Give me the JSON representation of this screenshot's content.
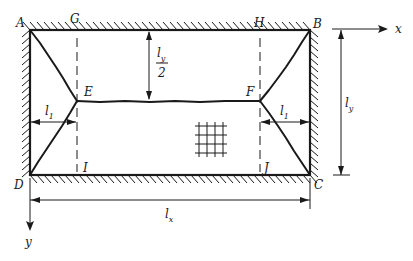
{
  "diagram": {
    "corner_labels": {
      "A": "A",
      "B": "B",
      "C": "C",
      "D": "D"
    },
    "point_labels": {
      "E": "E",
      "F": "F",
      "G": "G",
      "H": "H",
      "I": "I",
      "J": "J"
    },
    "axes": {
      "x": "x",
      "y": "y"
    },
    "dimensions": {
      "ly_half": {
        "main": "l",
        "sub": "y",
        "denominator": "2"
      },
      "ly": {
        "main": "l",
        "sub": "y"
      },
      "lx": {
        "main": "l",
        "sub": "x"
      },
      "l1_left": {
        "main": "l",
        "sub": "1"
      },
      "l1_right": {
        "main": "l",
        "sub": "1"
      }
    },
    "colors": {
      "ink": "#1a1a1a",
      "background": "#ffffff"
    }
  }
}
